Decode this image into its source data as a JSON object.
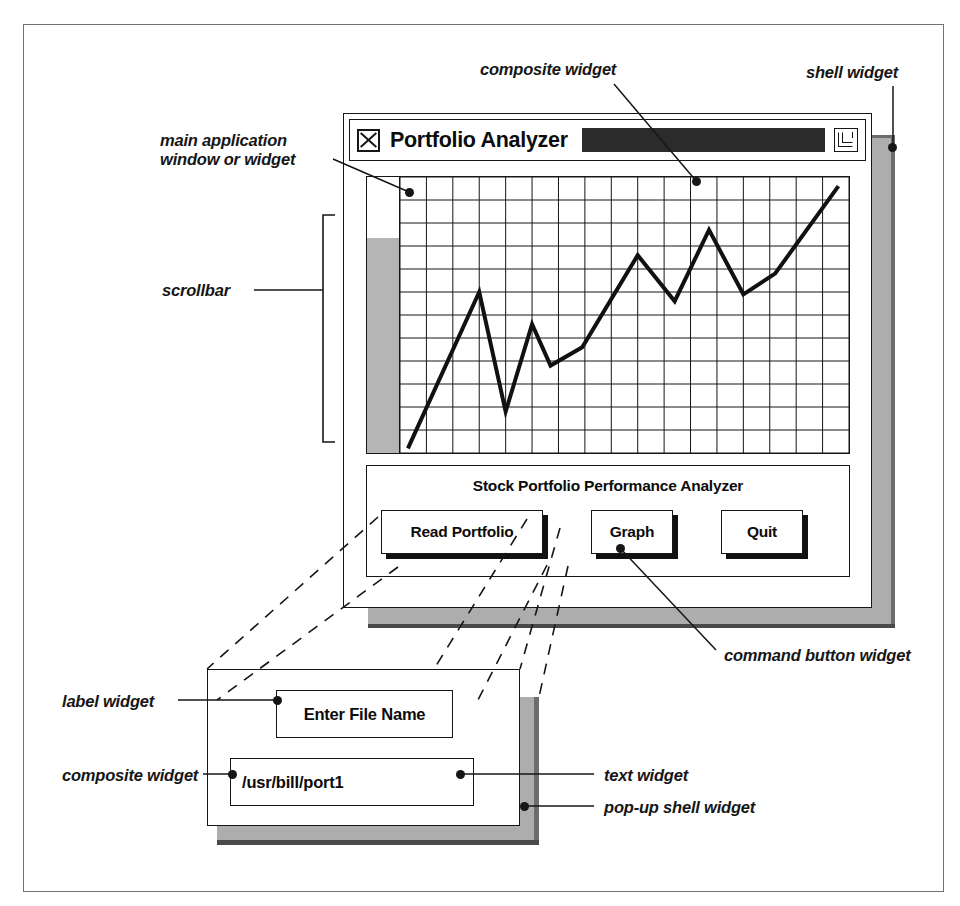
{
  "shell": {
    "label": "shell widget"
  },
  "main_window": {
    "annotation": "main application\nwindow or widget",
    "titlebar": {
      "app_icon_name": "window-x-icon",
      "title": "Portfolio Analyzer",
      "menu_icon_name": "window-menu-icon"
    }
  },
  "composite": {
    "annotation": "composite widget"
  },
  "scrollbar": {
    "annotation": "scrollbar",
    "thumb_position_percent": 22
  },
  "control_panel": {
    "title": "Stock Portfolio Performance Analyzer",
    "buttons": [
      {
        "label": "Read Portfolio"
      },
      {
        "label": "Graph"
      },
      {
        "label": "Quit"
      }
    ],
    "annotation": "command button widget"
  },
  "popup": {
    "annotation": "pop-up shell widget",
    "composite_annotation": "composite widget",
    "label_annotation": "label widget",
    "text_annotation": "text widget",
    "label_text": "Enter File Name",
    "text_value": "/usr/bill/port1",
    "text_placeholder": "Enter File Name"
  },
  "colors": {
    "ink": "#161616",
    "shadow_gray": "#adadad",
    "shadow_dark": "#4a4a4a",
    "titlebar_fill": "#2b2b2b",
    "scrollbar_thumb": "#b5b5b5",
    "frame": "#6f7378"
  },
  "chart_data": {
    "type": "line",
    "title": "",
    "xlabel": "",
    "ylabel": "",
    "grid": true,
    "legend": "none",
    "xlim": [
      0,
      17
    ],
    "ylim": [
      0,
      12
    ],
    "columns": 17,
    "rows": 12,
    "series": [
      {
        "name": "portfolio value",
        "x": [
          0.3,
          3.0,
          4.0,
          5.0,
          5.7,
          6.9,
          9.0,
          10.4,
          11.7,
          13.0,
          14.2,
          16.6
        ],
        "y": [
          0.2,
          7.0,
          1.8,
          5.6,
          3.8,
          4.6,
          8.6,
          6.6,
          9.7,
          6.9,
          7.8,
          11.6
        ]
      }
    ]
  }
}
